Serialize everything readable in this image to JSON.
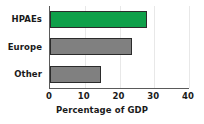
{
  "chart_data": {
    "type": "bar",
    "orientation": "horizontal",
    "title": "",
    "xlabel": "Percentage of GDP",
    "ylabel": "",
    "categories": [
      "HPAEs",
      "Europe",
      "Other"
    ],
    "values": [
      27.9,
      23.5,
      14.7
    ],
    "xlim": [
      0,
      40
    ],
    "xticks": [
      0,
      10,
      20,
      30,
      40
    ],
    "xtick_labels": [
      "0",
      "10",
      "20",
      "30",
      "40"
    ],
    "grid": true,
    "legend": false,
    "bar_colors": [
      "#0fa04a",
      "#808080",
      "#808080"
    ],
    "bar_edge_color": "#2b2b2b",
    "axis_color": "#5a5a5a",
    "grid_color": "#e8e8e8",
    "background": "#ffffff",
    "text_color": "#1a1a1a"
  }
}
